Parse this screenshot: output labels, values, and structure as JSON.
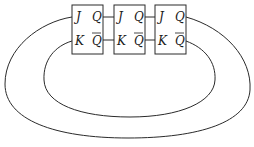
{
  "diagram": {
    "type": "ring counter (Johnson / twisted-ring) of JK flip-flops",
    "flip_flops": [
      {
        "id": "FF1",
        "inputs": {
          "j": "J",
          "k": "K"
        },
        "outputs": {
          "q": "Q",
          "qbar": "Q"
        }
      },
      {
        "id": "FF2",
        "inputs": {
          "j": "J",
          "k": "K"
        },
        "outputs": {
          "q": "Q",
          "qbar": "Q"
        }
      },
      {
        "id": "FF3",
        "inputs": {
          "j": "J",
          "k": "K"
        },
        "outputs": {
          "q": "Q",
          "qbar": "Q"
        }
      }
    ],
    "connections": [
      {
        "from": "FF1.Q",
        "to": "FF2.J"
      },
      {
        "from": "FF1.Qbar",
        "to": "FF2.K"
      },
      {
        "from": "FF2.Q",
        "to": "FF3.J"
      },
      {
        "from": "FF2.Qbar",
        "to": "FF3.K"
      },
      {
        "from": "FF3.Q",
        "to": "FF1.J",
        "path": "outer loop"
      },
      {
        "from": "FF3.Qbar",
        "to": "FF1.K",
        "path": "inner loop"
      }
    ]
  },
  "colors": {
    "line": "#2a2a2a",
    "background": "#ffffff",
    "text": "#1a1a1a"
  }
}
